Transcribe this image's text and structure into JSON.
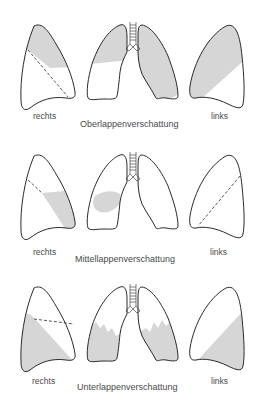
{
  "colors": {
    "outline": "#2a2a2a",
    "shading": "#d6d6d6",
    "text": "#4a4a4a",
    "background": "#ffffff"
  },
  "rows": [
    {
      "title": "Oberlappenverschattung",
      "label_right": "rechts",
      "label_left": "links"
    },
    {
      "title": "Mittellappenverschattung",
      "label_right": "rechts",
      "label_left": "links"
    },
    {
      "title": "Unterlappenverschattung",
      "label_right": "rechts",
      "label_left": "links"
    }
  ]
}
